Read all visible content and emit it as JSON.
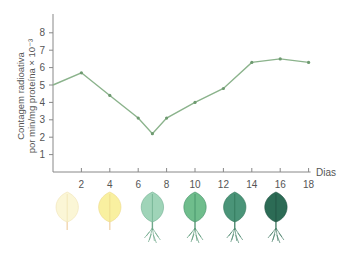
{
  "chart_data": {
    "type": "line",
    "title": "",
    "xlabel": "Dias",
    "ylabel_line1": "Contagem radioativa",
    "ylabel_line2": "por min/mg proteína × 10⁻³",
    "x": [
      0,
      2,
      4,
      6,
      7,
      8,
      10,
      12,
      14,
      16,
      18
    ],
    "values": [
      5.0,
      5.7,
      4.4,
      3.1,
      2.2,
      3.1,
      4.0,
      4.8,
      6.3,
      6.5,
      6.3
    ],
    "x_ticks": [
      "2",
      "4",
      "6",
      "8",
      "10",
      "12",
      "14",
      "16",
      "18"
    ],
    "y_ticks": [
      "1",
      "2",
      "3",
      "4",
      "5",
      "6",
      "7",
      "8"
    ],
    "xlim": [
      0,
      18
    ],
    "ylim": [
      0,
      9
    ],
    "grid": false,
    "legend": "none",
    "line_color": "#8bb38c",
    "marker_color": "#6e9a70"
  },
  "leaves": [
    {
      "day_position": 1,
      "stage": "etiolated-1",
      "fill": "#fbf6d6",
      "vein": "#f0e3b4",
      "stem": "#f2d6b0",
      "roots": false
    },
    {
      "day_position": 4,
      "stage": "etiolated-2",
      "fill": "#f9f0a0",
      "vein": "#ecd98a",
      "stem": "#f2d6b0",
      "roots": false
    },
    {
      "day_position": 7,
      "stage": "greening-1",
      "fill": "#9fd4b8",
      "vein": "#6fae90",
      "stem": "#6fa88a",
      "roots": true
    },
    {
      "day_position": 10,
      "stage": "greening-2",
      "fill": "#6fbd8c",
      "vein": "#3f8d64",
      "stem": "#5a9a78",
      "roots": true
    },
    {
      "day_position": 12.8,
      "stage": "green-1",
      "fill": "#4a9478",
      "vein": "#2f7358",
      "stem": "#4f8a70",
      "roots": true
    },
    {
      "day_position": 15.7,
      "stage": "green-2",
      "fill": "#2c6b55",
      "vein": "#1f5242",
      "stem": "#4a806a",
      "roots": true
    }
  ]
}
